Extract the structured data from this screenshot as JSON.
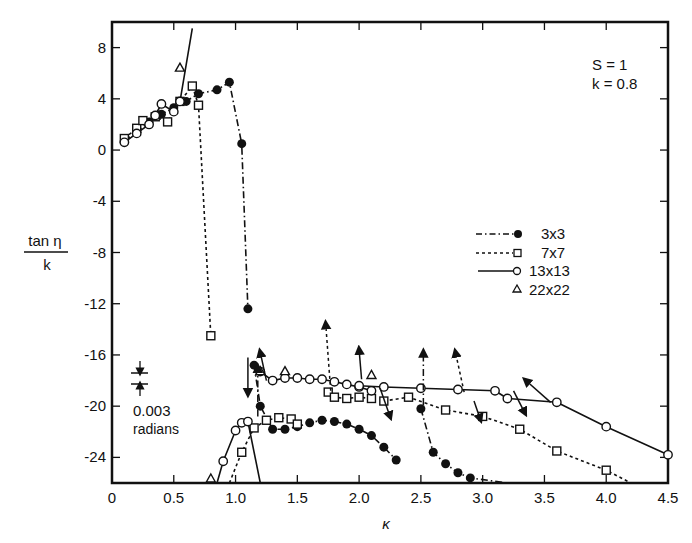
{
  "chart_data": {
    "type": "line",
    "title": "",
    "xlabel": "κ",
    "ylabel_numerator": "tan η",
    "ylabel_denominator": "k",
    "xlim": [
      0,
      4.5
    ],
    "ylim": [
      -26,
      10
    ],
    "x_ticks": [
      "0",
      "0.5",
      "1.0",
      "1.5",
      "2.0",
      "2.5",
      "3.0",
      "3.5",
      "4.0",
      "4.5"
    ],
    "y_ticks": [
      "8",
      "4",
      "0",
      "-4",
      "-8",
      "-12",
      "-16",
      "-20",
      "-24"
    ],
    "grid": false,
    "annotations": {
      "params_line1": "S = 1",
      "params_line2": "k = 0.8",
      "scale_value": "0.003",
      "scale_unit": "radians"
    },
    "legend": {
      "position": "right-middle",
      "entries": [
        {
          "label": "3x3",
          "line": "dash-dot",
          "marker": "filled-circle"
        },
        {
          "label": "7x7",
          "line": "dotted",
          "marker": "open-square"
        },
        {
          "label": "13x13",
          "line": "solid",
          "marker": "open-circle"
        },
        {
          "label": "22x22",
          "line": "none",
          "marker": "open-triangle"
        }
      ]
    },
    "series": [
      {
        "name": "3x3",
        "branches": [
          {
            "x": [
              0.1,
              0.2,
              0.3,
              0.4,
              0.5,
              0.6,
              0.7,
              0.85,
              0.95,
              1.05,
              1.1
            ],
            "y": [
              0.7,
              1.4,
              2.2,
              2.8,
              3.3,
              3.8,
              4.4,
              4.7,
              5.3,
              0.5,
              -12.4
            ]
          },
          {
            "x": [
              1.15,
              1.2,
              1.3,
              1.4,
              1.5,
              1.6,
              1.7,
              1.8,
              1.9,
              2.0,
              2.1,
              2.2,
              2.3
            ],
            "y": [
              -16.8,
              -20.0,
              -21.8,
              -21.8,
              -21.6,
              -21.3,
              -21.1,
              -21.2,
              -21.4,
              -21.8,
              -22.3,
              -23.2,
              -24.2
            ]
          },
          {
            "x": [
              2.5,
              2.6,
              2.7,
              2.8,
              2.9,
              3.2
            ],
            "y": [
              -20.2,
              -23.6,
              -24.5,
              -25.2,
              -25.6,
              -26.0
            ]
          }
        ]
      },
      {
        "name": "7x7",
        "branches": [
          {
            "x": [
              0.1,
              0.2,
              0.25,
              0.35,
              0.45,
              0.55,
              0.65,
              0.7,
              0.8
            ],
            "y": [
              0.9,
              1.7,
              2.3,
              2.6,
              2.2,
              3.8,
              5.0,
              3.5,
              -14.5
            ]
          },
          {
            "x": [
              0.95,
              1.05,
              1.15,
              1.25,
              1.35,
              1.45,
              1.5
            ],
            "y": [
              -26.0,
              -23.6,
              -21.7,
              -21.1,
              -20.9,
              -21.0,
              -21.4
            ]
          },
          {
            "x": [
              1.75,
              1.8,
              1.9,
              2.0,
              2.1
            ],
            "y": [
              -18.9,
              -19.3,
              -19.4,
              -19.3,
              -19.4
            ]
          },
          {
            "x": [
              2.2,
              2.4,
              2.7,
              3.0,
              3.3,
              3.6,
              4.0,
              4.2
            ],
            "y": [
              -19.6,
              -19.3,
              -20.3,
              -20.8,
              -21.8,
              -23.5,
              -25.0,
              -26.0
            ]
          }
        ]
      },
      {
        "name": "13x13",
        "branches": [
          {
            "x": [
              0.1,
              0.2,
              0.3,
              0.35,
              0.4,
              0.5,
              0.55,
              0.65
            ],
            "y": [
              0.6,
              1.3,
              2.0,
              2.7,
              3.6,
              3.0,
              3.8,
              9.5
            ]
          },
          {
            "x": [
              0.85,
              0.9,
              1.0,
              1.05,
              1.1,
              1.2
            ],
            "y": [
              -26.0,
              -24.3,
              -21.9,
              -21.3,
              -21.2,
              -26.0
            ]
          },
          {
            "x": [
              1.2,
              1.3,
              1.4,
              1.5,
              1.6,
              1.7,
              1.8,
              1.9,
              2.0,
              2.1
            ],
            "y": [
              -17.3,
              -18.0,
              -17.8,
              -17.8,
              -17.9,
              -17.9,
              -18.1,
              -18.3,
              -18.5,
              -18.8
            ]
          },
          {
            "x": [
              2.0,
              2.2,
              2.5,
              2.8,
              3.1,
              3.2,
              3.6,
              4.0,
              4.5
            ],
            "y": [
              -18.4,
              -18.5,
              -18.6,
              -18.7,
              -18.8,
              -19.4,
              -19.7,
              -21.6,
              -23.8
            ]
          }
        ]
      },
      {
        "name": "22x22",
        "points": {
          "x": [
            0.55,
            0.8,
            1.2,
            1.4,
            2.1
          ],
          "y": [
            6.4,
            -26.0,
            -17.3,
            -17.3,
            -17.6
          ]
        }
      }
    ]
  }
}
